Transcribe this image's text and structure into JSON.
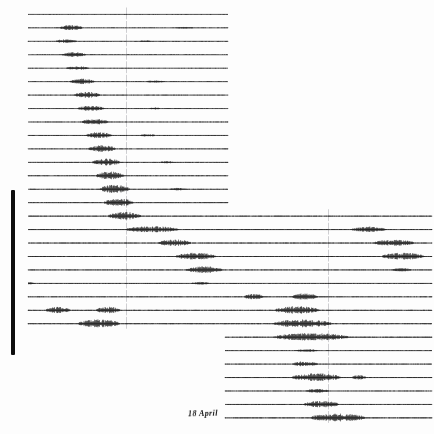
{
  "record": {
    "title_strip": "SEISMOGRAM RECORD SHEET   STATION ARCHIVE",
    "date_label": "18 April",
    "margin_bar_name": "left-margin-bar",
    "ink_color": "#101010",
    "paper_color": "#fdfdfd",
    "timing_mark_color": "#b9b9bd"
  },
  "chart_data": {
    "type": "line",
    "title": "18 April",
    "xlabel": "",
    "ylabel": "",
    "x": [
      0,
      1
    ],
    "grid": false,
    "legend": "none",
    "axis_ranges": {
      "x": [
        0,
        434
      ],
      "y": [
        0,
        434
      ]
    },
    "timing_marks_x": [
      126,
      328
    ],
    "trace_geometry": {
      "top": 14.0,
      "spacing": 13.45,
      "count": 31,
      "left_x": 28,
      "right_x": 432,
      "left_col_end": 228,
      "right_col_start": 225,
      "split_row_upper": 15,
      "split_row_lower": 23
    },
    "series": [
      {
        "name": "trace-01",
        "row": 0,
        "span": "left",
        "baseline_noise": 0.25,
        "bursts": []
      },
      {
        "name": "trace-02",
        "row": 1,
        "span": "left",
        "baseline_noise": 0.3,
        "bursts": [
          {
            "x0": 60,
            "x1": 86,
            "amp": 1.9
          },
          {
            "x0": 176,
            "x1": 196,
            "amp": 0.5
          }
        ]
      },
      {
        "name": "trace-03",
        "row": 2,
        "span": "left",
        "baseline_noise": 0.3,
        "bursts": [
          {
            "x0": 56,
            "x1": 80,
            "amp": 1.5
          },
          {
            "x0": 140,
            "x1": 152,
            "amp": 0.6
          }
        ]
      },
      {
        "name": "trace-04",
        "row": 3,
        "span": "left",
        "baseline_noise": 0.3,
        "bursts": [
          {
            "x0": 62,
            "x1": 90,
            "amp": 2.0
          }
        ]
      },
      {
        "name": "trace-05",
        "row": 4,
        "span": "left",
        "baseline_noise": 0.28,
        "bursts": [
          {
            "x0": 66,
            "x1": 92,
            "amp": 1.4
          }
        ]
      },
      {
        "name": "trace-06",
        "row": 5,
        "span": "left",
        "baseline_noise": 0.3,
        "bursts": [
          {
            "x0": 70,
            "x1": 98,
            "amp": 2.2
          },
          {
            "x0": 146,
            "x1": 168,
            "amp": 0.7
          }
        ]
      },
      {
        "name": "trace-07",
        "row": 6,
        "span": "left",
        "baseline_noise": 0.32,
        "bursts": [
          {
            "x0": 74,
            "x1": 104,
            "amp": 2.4
          }
        ]
      },
      {
        "name": "trace-08",
        "row": 7,
        "span": "left",
        "baseline_noise": 0.3,
        "bursts": [
          {
            "x0": 78,
            "x1": 108,
            "amp": 2.0
          },
          {
            "x0": 150,
            "x1": 162,
            "amp": 0.6
          }
        ]
      },
      {
        "name": "trace-09",
        "row": 8,
        "span": "left",
        "baseline_noise": 0.32,
        "bursts": [
          {
            "x0": 82,
            "x1": 112,
            "amp": 2.3
          }
        ]
      },
      {
        "name": "trace-10",
        "row": 9,
        "span": "left",
        "baseline_noise": 0.34,
        "bursts": [
          {
            "x0": 86,
            "x1": 116,
            "amp": 2.6
          },
          {
            "x0": 140,
            "x1": 158,
            "amp": 0.8
          }
        ]
      },
      {
        "name": "trace-11",
        "row": 10,
        "span": "left",
        "baseline_noise": 0.34,
        "bursts": [
          {
            "x0": 88,
            "x1": 120,
            "amp": 2.8
          }
        ]
      },
      {
        "name": "trace-12",
        "row": 11,
        "span": "left",
        "baseline_noise": 0.36,
        "bursts": [
          {
            "x0": 92,
            "x1": 124,
            "amp": 3.0
          },
          {
            "x0": 160,
            "x1": 176,
            "amp": 0.7
          }
        ]
      },
      {
        "name": "trace-13",
        "row": 12,
        "span": "left",
        "baseline_noise": 0.36,
        "bursts": [
          {
            "x0": 96,
            "x1": 128,
            "amp": 3.2
          }
        ]
      },
      {
        "name": "trace-14",
        "row": 13,
        "span": "left",
        "baseline_noise": 0.38,
        "bursts": [
          {
            "x0": 100,
            "x1": 134,
            "amp": 3.4
          },
          {
            "x0": 170,
            "x1": 188,
            "amp": 0.8
          }
        ]
      },
      {
        "name": "trace-15",
        "row": 14,
        "span": "left",
        "baseline_noise": 0.38,
        "bursts": [
          {
            "x0": 104,
            "x1": 138,
            "amp": 3.0
          }
        ]
      },
      {
        "name": "trace-16",
        "row": 15,
        "span": "full",
        "baseline_noise": 0.4,
        "bursts": [
          {
            "x0": 108,
            "x1": 146,
            "amp": 3.2
          }
        ]
      },
      {
        "name": "trace-17",
        "row": 16,
        "span": "full",
        "baseline_noise": 0.42,
        "bursts": [
          {
            "x0": 126,
            "x1": 186,
            "amp": 2.4
          },
          {
            "x0": 352,
            "x1": 392,
            "amp": 2.0
          }
        ]
      },
      {
        "name": "trace-18",
        "row": 17,
        "span": "full",
        "baseline_noise": 0.42,
        "bursts": [
          {
            "x0": 158,
            "x1": 196,
            "amp": 2.6
          },
          {
            "x0": 374,
            "x1": 420,
            "amp": 2.4
          }
        ]
      },
      {
        "name": "trace-19",
        "row": 18,
        "span": "full",
        "baseline_noise": 0.44,
        "bursts": [
          {
            "x0": 176,
            "x1": 222,
            "amp": 2.8
          },
          {
            "x0": 382,
            "x1": 430,
            "amp": 2.8
          }
        ]
      },
      {
        "name": "trace-20",
        "row": 19,
        "span": "full",
        "baseline_noise": 0.4,
        "bursts": [
          {
            "x0": 186,
            "x1": 228,
            "amp": 2.6
          },
          {
            "x0": 392,
            "x1": 414,
            "amp": 1.2
          }
        ]
      },
      {
        "name": "trace-21",
        "row": 20,
        "span": "full",
        "baseline_noise": 0.36,
        "bursts": [
          {
            "x0": 28,
            "x1": 34,
            "amp": 1.6
          },
          {
            "x0": 192,
            "x1": 212,
            "amp": 1.0
          }
        ]
      },
      {
        "name": "trace-22",
        "row": 21,
        "span": "full",
        "baseline_noise": 0.38,
        "bursts": [
          {
            "x0": 244,
            "x1": 266,
            "amp": 2.2
          },
          {
            "x0": 292,
            "x1": 322,
            "amp": 2.6
          }
        ]
      },
      {
        "name": "trace-23",
        "row": 22,
        "span": "full",
        "baseline_noise": 0.42,
        "bursts": [
          {
            "x0": 46,
            "x1": 74,
            "amp": 2.4
          },
          {
            "x0": 96,
            "x1": 124,
            "amp": 2.6
          },
          {
            "x0": 274,
            "x1": 326,
            "amp": 3.0
          }
        ]
      },
      {
        "name": "trace-24",
        "row": 23,
        "span": "full",
        "baseline_noise": 0.44,
        "bursts": [
          {
            "x0": 78,
            "x1": 126,
            "amp": 3.2
          },
          {
            "x0": 274,
            "x1": 340,
            "amp": 3.2
          }
        ]
      },
      {
        "name": "trace-25",
        "row": 24,
        "span": "right",
        "baseline_noise": 0.44,
        "bursts": [
          {
            "x0": 274,
            "x1": 360,
            "amp": 3.0
          }
        ]
      },
      {
        "name": "trace-26",
        "row": 25,
        "span": "right",
        "baseline_noise": 0.34,
        "bursts": [
          {
            "x0": 296,
            "x1": 322,
            "amp": 0.9
          }
        ]
      },
      {
        "name": "trace-27",
        "row": 26,
        "span": "right",
        "baseline_noise": 0.36,
        "bursts": [
          {
            "x0": 292,
            "x1": 322,
            "amp": 2.0
          }
        ]
      },
      {
        "name": "trace-28",
        "row": 27,
        "span": "right",
        "baseline_noise": 0.44,
        "bursts": [
          {
            "x0": 292,
            "x1": 348,
            "amp": 3.2
          },
          {
            "x0": 352,
            "x1": 368,
            "amp": 1.6
          }
        ]
      },
      {
        "name": "trace-29",
        "row": 28,
        "span": "right",
        "baseline_noise": 0.32,
        "bursts": [
          {
            "x0": 306,
            "x1": 332,
            "amp": 1.4
          }
        ]
      },
      {
        "name": "trace-30",
        "row": 29,
        "span": "right",
        "baseline_noise": 0.4,
        "bursts": [
          {
            "x0": 304,
            "x1": 344,
            "amp": 2.6
          }
        ]
      },
      {
        "name": "trace-31",
        "row": 30,
        "span": "right",
        "baseline_noise": 0.46,
        "bursts": [
          {
            "x0": 310,
            "x1": 374,
            "amp": 3.2
          }
        ]
      }
    ]
  }
}
